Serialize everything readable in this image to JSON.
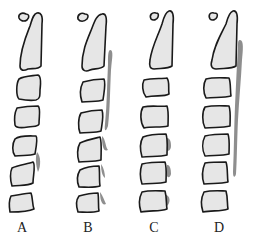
{
  "figure": {
    "colors": {
      "bone_fill": "#e6e6e6",
      "outline": "#1a1a1a",
      "ossification": "#7a7a7a",
      "background": "#ffffff"
    },
    "columns": [
      {
        "label": "A",
        "label_x": 22,
        "shapes": [
          "M26 14 C22 12 18 14 19 18 C20 21 24 22 27 20 C30 17 29 14 26 14 Z",
          "M37 13 C41 12 43 16 42 24 L41 66 C38 70 32 68 28 69 C24 71 20 71 20 66 C20 50 26 36 30 26 C32 20 33 14 37 13 Z",
          "M19 79 C24 76 32 76 38 75 C41 76 41 82 40 90 C40 96 40 99 36 100 C30 101 24 100 19 99 C16 96 16 84 19 79 Z",
          "M17 108 C22 107 32 106 38 106 C41 108 39 116 39 124 C38 127 34 126 28 127 C22 128 16 128 15 125 C14 118 15 112 17 108 Z",
          "M15 139 C20 135 30 136 36 136 C38 138 36 148 35 154 C30 156 22 155 15 156 C12 152 12 144 15 139 Z",
          "M12 168 C18 165 28 164 33 162 C36 164 33 176 33 183 C28 186 20 185 12 186 C10 180 10 172 12 168 Z",
          "M11 196 C18 195 26 193 31 193 C33 198 32 204 34 209 C28 212 18 212 10 212 C9 206 9 200 11 196 Z"
        ],
        "ossification": [
          "M37 152 C41 156 41 166 38 172 C36 166 35 158 37 152 Z"
        ]
      },
      {
        "label": "B",
        "label_x": 88,
        "shapes": [
          "M85 14 C81 12 77 15 78 19 C80 22 84 22 87 19 C89 16 88 14 85 14 Z",
          "M102 14 C106 13 107 18 106 26 L104 66 C100 70 94 68 90 70 C86 72 82 71 82 66 C82 50 88 38 92 28 C95 20 97 15 102 14 Z",
          "M83 82 C90 80 100 79 104 79 C106 84 104 92 103 100 C98 102 90 101 82 102 C80 96 80 88 83 82 Z",
          "M81 113 C88 111 98 110 102 110 C104 116 102 124 101 131 C96 133 88 132 80 133 C78 128 78 118 81 113 Z",
          "M80 143 C86 140 96 138 100 137 C102 142 101 152 101 160 C94 162 86 161 79 162 C77 156 77 148 80 143 Z",
          "M80 170 C86 167 94 166 99 166 C100 172 99 180 100 186 C94 188 86 187 79 187 C77 182 77 175 80 170 Z",
          "M79 196 C86 194 94 193 98 193 C99 200 98 206 99 211 C92 213 84 212 78 212 C76 206 76 200 79 196 Z"
        ],
        "ossification": [
          "M110 50 C114 50 112 58 111 70 C110 90 110 110 108 126 C106 132 104 132 105 124 C107 104 107 84 108 64 C108 56 108 51 110 50 Z",
          "M102 136 C106 140 105 146 108 150 C104 152 102 148 102 136 Z",
          "M101 164 C104 168 105 174 105 178 C102 176 101 170 101 164 Z",
          "M100 192 C103 196 104 200 106 204 C102 206 100 200 100 192 Z"
        ]
      },
      {
        "label": "C",
        "label_x": 154,
        "shapes": [
          "M156 13 C152 12 149 15 151 19 C153 21 157 20 158 17 C159 14 158 13 156 13 Z",
          "M169 11 C173 10 174 16 173 24 L172 66 C168 69 160 68 154 69 C150 69 149 66 150 60 C152 46 158 36 162 24 C164 16 166 12 169 11 Z",
          "M144 80 C152 78 162 79 167 78 C170 82 168 88 169 94 C164 97 156 95 146 97 C142 92 142 84 144 80 Z",
          "M143 107 C152 105 160 107 167 106 C169 112 168 120 168 126 C160 128 152 126 144 128 C140 122 140 112 143 107 Z",
          "M143 137 C150 134 160 134 166 134 C168 140 167 148 167 155 C160 157 150 156 142 157 C140 150 140 142 143 137 Z",
          "M142 164 C150 162 160 162 165 162 C167 168 166 176 166 182 C160 184 150 183 142 184 C140 178 140 170 142 164 Z",
          "M142 192 C150 190 160 191 165 191 C167 198 166 204 167 209 C160 212 150 210 141 212 C139 206 139 198 142 192 Z"
        ],
        "ossification": [
          "M167 138 C170 138 171 142 171 146 C171 150 168 152 167 150 Z",
          "M167 165 C170 164 171 170 171 174 C170 178 168 178 167 176 Z",
          "M166 195 C170 196 171 202 167 206 Z"
        ]
      },
      {
        "label": "D",
        "label_x": 219,
        "shapes": [
          "M214 13 C210 12 208 15 210 19 C212 21 216 20 217 17 C218 14 217 13 214 13 Z",
          "M233 11 C237 10 238 16 237 24 L236 66 C232 69 224 68 216 69 C212 69 210 66 212 60 C214 46 220 36 226 24 C228 16 230 12 233 11 Z",
          "M206 79 C214 77 224 78 229 78 C231 83 230 90 231 96 C224 98 214 97 206 98 C203 92 203 84 206 79 Z",
          "M205 107 C214 105 224 106 229 106 C231 112 230 120 230 126 C222 128 214 127 205 128 C202 122 202 112 205 107 Z",
          "M205 136 C213 134 222 134 228 134 C230 140 229 148 229 154 C222 156 212 155 205 156 C202 150 202 142 205 136 Z",
          "M205 163 C212 162 222 162 226 162 C228 168 227 176 228 182 C220 184 212 183 204 184 C202 178 202 170 205 163 Z",
          "M204 192 C212 190 222 191 226 191 C228 198 227 204 228 209 C220 212 212 210 203 212 C201 206 201 198 204 192 Z"
        ],
        "ossification": [
          "M240 40 C244 40 243 50 242 60 C241 80 239 100 238 120 C237 140 237 160 236 174 C235 178 233 178 233 172 C234 150 234 128 235 106 C236 84 237 62 238 48 C238 42 238 40 240 40 Z"
        ]
      }
    ]
  }
}
